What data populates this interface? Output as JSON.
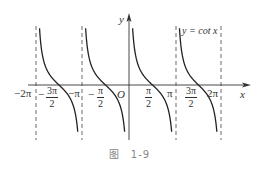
{
  "chart_data": {
    "type": "line",
    "title": "",
    "function": "y = cot x",
    "curve_label": "y = cot x",
    "xlabel": "x",
    "ylabel": "y",
    "origin_label": "O",
    "x_ticks": [
      "-2π",
      "-3π/2",
      "-π",
      "-π/2",
      "π/2",
      "π",
      "3π/2",
      "2π"
    ],
    "asymptotes": [
      "-2π",
      "-π",
      "0",
      "π",
      "2π"
    ],
    "zeros": [
      "-3π/2",
      "-π/2",
      "π/2",
      "3π/2"
    ],
    "xlim": [
      "-2π",
      "2π"
    ],
    "branches": [
      {
        "interval": "(-2π, -π)",
        "zero": "-3π/2"
      },
      {
        "interval": "(-π, 0)",
        "zero": "-π/2"
      },
      {
        "interval": "(0, π)",
        "zero": "π/2"
      },
      {
        "interval": "(π, 2π)",
        "zero": "3π/2"
      }
    ],
    "grid": false,
    "legend": false
  },
  "labels": {
    "neg_two_pi": "−2π",
    "neg_three_pi_half_num": "3π",
    "neg_three_pi_half_den": "2",
    "neg_pi": "−π",
    "neg_pi_half_num": "π",
    "neg_pi_half_den": "2",
    "origin": "O",
    "pi_half_num": "π",
    "pi_half_den": "2",
    "pi": "π",
    "three_pi_half_num": "3π",
    "three_pi_half_den": "2",
    "two_pi": "2π",
    "x_axis": "x",
    "y_axis": "y",
    "curve": "y = cot x",
    "minus": "−"
  },
  "caption": "图　1-9"
}
